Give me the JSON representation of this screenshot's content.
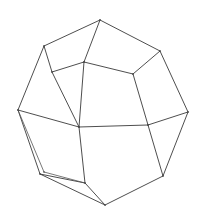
{
  "figure": {
    "shape_name": "dodecahedron",
    "render_style": "wireframe-outline",
    "background_color": "#ffffff",
    "stroke_color": "#3a3a3a",
    "stroke_color_soft": "#555555",
    "stroke_width": 0.9,
    "canvas": {
      "width": 203,
      "height": 216
    },
    "vertices": [
      {
        "id": "v-top-apex",
        "x": 100,
        "y": 20
      },
      {
        "id": "v-upper-left",
        "x": 44,
        "y": 46
      },
      {
        "id": "v-upper-right",
        "x": 160,
        "y": 51
      },
      {
        "id": "v-center-upper",
        "x": 84,
        "y": 62
      },
      {
        "id": "v-inner-left",
        "x": 52,
        "y": 72
      },
      {
        "id": "v-inner-right",
        "x": 133,
        "y": 74
      },
      {
        "id": "v-left-mid",
        "x": 18,
        "y": 110
      },
      {
        "id": "v-right-mid",
        "x": 188,
        "y": 112
      },
      {
        "id": "v-center-lower",
        "x": 79,
        "y": 127
      },
      {
        "id": "v-right-lower",
        "x": 148,
        "y": 125
      },
      {
        "id": "v-left-lower",
        "x": 40,
        "y": 174
      },
      {
        "id": "v-left-lower-alt",
        "x": 44,
        "y": 172
      },
      {
        "id": "v-bottom-left",
        "x": 85,
        "y": 183
      },
      {
        "id": "v-bottom-right",
        "x": 163,
        "y": 176
      },
      {
        "id": "v-bottom-apex",
        "x": 105,
        "y": 205
      }
    ],
    "edges": [
      {
        "from": "v-top-apex",
        "to": "v-upper-left",
        "kind": "outline"
      },
      {
        "from": "v-top-apex",
        "to": "v-upper-right",
        "kind": "outline"
      },
      {
        "from": "v-top-apex",
        "to": "v-center-upper",
        "kind": "interior"
      },
      {
        "from": "v-upper-left",
        "to": "v-inner-left",
        "kind": "interior"
      },
      {
        "from": "v-upper-left",
        "to": "v-left-mid",
        "kind": "outline"
      },
      {
        "from": "v-upper-right",
        "to": "v-inner-right",
        "kind": "interior"
      },
      {
        "from": "v-upper-right",
        "to": "v-right-mid",
        "kind": "outline"
      },
      {
        "from": "v-center-upper",
        "to": "v-inner-left",
        "kind": "interior"
      },
      {
        "from": "v-center-upper",
        "to": "v-inner-right",
        "kind": "interior"
      },
      {
        "from": "v-center-upper",
        "to": "v-center-lower",
        "kind": "interior"
      },
      {
        "from": "v-inner-left",
        "to": "v-center-lower",
        "kind": "interior"
      },
      {
        "from": "v-inner-right",
        "to": "v-right-lower",
        "kind": "interior"
      },
      {
        "from": "v-left-mid",
        "to": "v-center-lower",
        "kind": "interior"
      },
      {
        "from": "v-left-mid",
        "to": "v-left-lower",
        "kind": "outline"
      },
      {
        "from": "v-left-mid",
        "to": "v-left-lower-alt",
        "kind": "outline-double"
      },
      {
        "from": "v-right-mid",
        "to": "v-right-lower",
        "kind": "interior"
      },
      {
        "from": "v-right-mid",
        "to": "v-bottom-right",
        "kind": "outline"
      },
      {
        "from": "v-center-lower",
        "to": "v-right-lower",
        "kind": "interior"
      },
      {
        "from": "v-center-lower",
        "to": "v-bottom-left",
        "kind": "interior"
      },
      {
        "from": "v-right-lower",
        "to": "v-bottom-right",
        "kind": "interior"
      },
      {
        "from": "v-left-lower",
        "to": "v-bottom-left",
        "kind": "outline"
      },
      {
        "from": "v-left-lower-alt",
        "to": "v-bottom-left",
        "kind": "outline-double"
      },
      {
        "from": "v-left-lower",
        "to": "v-bottom-apex",
        "kind": "outline"
      },
      {
        "from": "v-bottom-left",
        "to": "v-bottom-apex",
        "kind": "interior"
      },
      {
        "from": "v-bottom-right",
        "to": "v-bottom-apex",
        "kind": "outline"
      }
    ],
    "faces": [
      {
        "id": "face-top",
        "vertices": [
          "v-top-apex",
          "v-upper-left",
          "v-inner-left",
          "v-center-upper"
        ]
      },
      {
        "id": "face-top-right",
        "vertices": [
          "v-top-apex",
          "v-center-upper",
          "v-inner-right",
          "v-upper-right"
        ]
      },
      {
        "id": "face-left",
        "vertices": [
          "v-upper-left",
          "v-left-mid",
          "v-center-lower",
          "v-inner-left"
        ]
      },
      {
        "id": "face-center-front",
        "vertices": [
          "v-center-upper",
          "v-inner-right",
          "v-right-lower",
          "v-center-lower"
        ]
      },
      {
        "id": "face-right",
        "vertices": [
          "v-upper-right",
          "v-right-mid",
          "v-right-lower",
          "v-inner-right"
        ]
      },
      {
        "id": "face-bottom-left",
        "vertices": [
          "v-left-mid",
          "v-left-lower",
          "v-bottom-left",
          "v-center-lower"
        ]
      },
      {
        "id": "face-bottom",
        "vertices": [
          "v-center-lower",
          "v-bottom-left",
          "v-bottom-apex",
          "v-bottom-right",
          "v-right-lower"
        ]
      },
      {
        "id": "face-bottom-right",
        "vertices": [
          "v-right-lower",
          "v-bottom-right",
          "v-right-mid"
        ]
      }
    ]
  }
}
